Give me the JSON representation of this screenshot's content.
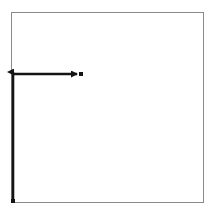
{
  "canvas": {
    "width": 211,
    "height": 212,
    "background_color": "#ffffff"
  },
  "frame": {
    "name": "bounding-box",
    "x": 11,
    "y": 12,
    "width": 192,
    "height": 190,
    "stroke_color": "#8a8a8a",
    "stroke_width": 1,
    "fill": "none"
  },
  "chart_data": {
    "type": "scatter",
    "title": "",
    "xlabel": "",
    "ylabel": "",
    "grid": false,
    "legend": null,
    "xlim": [
      11,
      203
    ],
    "ylim": [
      12,
      202
    ],
    "annotations": [
      {
        "name": "vertical-vector",
        "kind": "arrow",
        "from_x": 13,
        "from_y": 201,
        "to_x": 13,
        "to_y": 72,
        "direction": "up",
        "color": "#141414",
        "stroke_width": 2.6,
        "arrowhead": "triangle",
        "arrowhead_at": "end",
        "tail_marker": "dot"
      },
      {
        "name": "horizontal-vector",
        "kind": "arrow",
        "from_x": 13,
        "from_y": 74,
        "to_x": 77,
        "to_y": 74,
        "direction": "right",
        "color": "#141414",
        "stroke_width": 2.4,
        "arrowhead": "triangle",
        "arrowhead_at": "end",
        "tail_marker": "none"
      },
      {
        "name": "terminal-point",
        "kind": "dot",
        "x": 81,
        "y": 74,
        "size": 4,
        "color": "#141414",
        "shape": "square"
      },
      {
        "name": "origin-point",
        "kind": "dot",
        "x": 13,
        "y": 201,
        "size": 4,
        "color": "#141414",
        "shape": "square"
      }
    ],
    "labels": []
  },
  "colors": {
    "ink": "#141414",
    "frame": "#8a8a8a",
    "paper": "#ffffff"
  }
}
